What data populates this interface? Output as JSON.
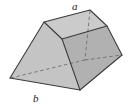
{
  "figure": {
    "shape_type": "frustum",
    "background_color": "#ffffff",
    "edge_color": "#3c3c3c",
    "hidden_edge_color": "#6e6e6e",
    "labels": {
      "top_edge": "a",
      "bottom_edge": "b"
    },
    "faces": [
      {
        "name": "top-face",
        "fill": "#c9c9c9",
        "vertices": "44,22 90,10 107,26 62,39"
      },
      {
        "name": "front-left-face",
        "fill": "#c2c2c2",
        "vertices": "44,22 62,39 80,90 10,78"
      },
      {
        "name": "front-right-face",
        "fill": "#b0b0b0",
        "vertices": "62,39 107,26 122,55 80,90"
      },
      {
        "name": "hidden-back-left-face",
        "fill": "#cfcfcf",
        "vertices": "44,22 90,10 122,55 10,78"
      }
    ],
    "visible_edges": [
      {
        "name": "top-back-left-edge",
        "path": "44,22 90,10"
      },
      {
        "name": "top-back-right-edge",
        "path": "90,10 107,26"
      },
      {
        "name": "top-front-right-edge",
        "path": "107,26 62,39"
      },
      {
        "name": "top-front-left-edge",
        "path": "62,39 44,22"
      },
      {
        "name": "vertical-left-edge",
        "path": "44,22 10,78"
      },
      {
        "name": "vertical-front-edge",
        "path": "62,39 80,90"
      },
      {
        "name": "vertical-right-edge",
        "path": "107,26 122,55"
      },
      {
        "name": "base-front-left-edge",
        "path": "10,78 80,90"
      },
      {
        "name": "base-front-right-edge",
        "path": "80,90 122,55"
      }
    ],
    "hidden_edges": [
      {
        "name": "hidden-vertical-back-edge",
        "path": "90,10 84,60"
      },
      {
        "name": "hidden-base-back-left-edge",
        "path": "10,78 84,60"
      },
      {
        "name": "hidden-base-back-right-edge",
        "path": "84,60 122,55"
      }
    ]
  }
}
